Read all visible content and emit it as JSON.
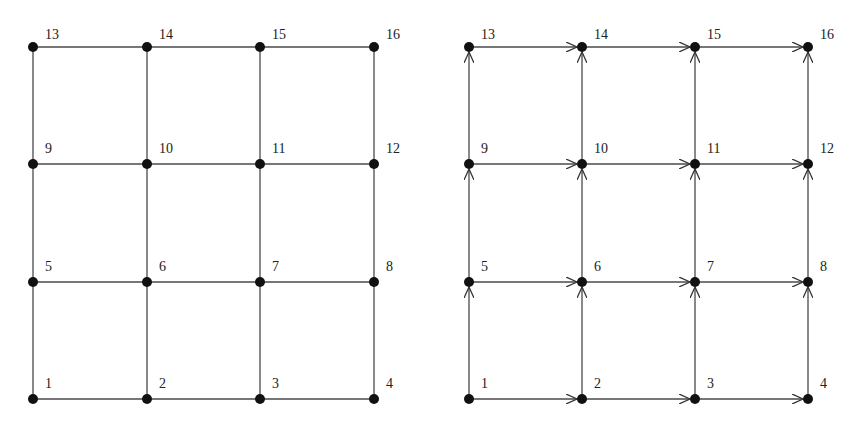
{
  "diagram": {
    "title": "",
    "graphs": [
      {
        "id": "undirected-grid",
        "directed": false,
        "cols_x": [
          33,
          147,
          260,
          374
        ],
        "rows_y": [
          399,
          282,
          164,
          47
        ],
        "nodes": [
          "1",
          "2",
          "3",
          "4",
          "5",
          "6",
          "7",
          "8",
          "9",
          "10",
          "11",
          "12",
          "13",
          "14",
          "15",
          "16"
        ]
      },
      {
        "id": "directed-grid",
        "directed": true,
        "cols_x": [
          469,
          582,
          695,
          808
        ],
        "rows_y": [
          399,
          282,
          164,
          47
        ],
        "nodes": [
          "1",
          "2",
          "3",
          "4",
          "5",
          "6",
          "7",
          "8",
          "9",
          "10",
          "11",
          "12",
          "13",
          "14",
          "15",
          "16"
        ],
        "edge_direction": "rightward and upward"
      }
    ],
    "colors": {
      "edge": "#4a4a4a",
      "node": "#111111",
      "label": "#222222",
      "background": "#ffffff"
    }
  }
}
